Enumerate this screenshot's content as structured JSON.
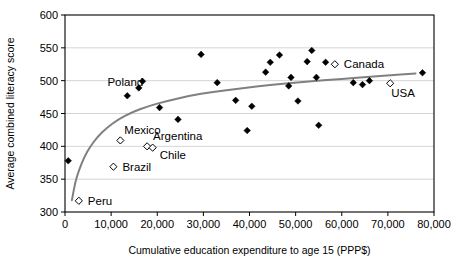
{
  "chart_data": {
    "type": "scatter",
    "title": "",
    "xlabel": "Cumulative education expenditure to age 15 (PPP$)",
    "ylabel": "Average combined literacy score",
    "xlim": [
      0,
      80000
    ],
    "ylim": [
      300,
      600
    ],
    "xticks": [
      0,
      10000,
      20000,
      30000,
      40000,
      50000,
      60000,
      70000,
      80000
    ],
    "xticklabels": [
      "0",
      "10,000",
      "20,000",
      "30,000",
      "40,000",
      "50,000",
      "60,000",
      "70,000",
      "80,000"
    ],
    "yticks": [
      300,
      350,
      400,
      450,
      500,
      550,
      600
    ],
    "yticklabels": [
      "300",
      "350",
      "400",
      "450",
      "500",
      "550",
      "600"
    ],
    "grid": "horizontal",
    "legend": "none",
    "series": [
      {
        "name": "Countries (unlabelled)",
        "marker": "filled-diamond",
        "color": "#000000",
        "points": [
          {
            "x": 700,
            "y": 378
          },
          {
            "x": 13500,
            "y": 477
          },
          {
            "x": 16000,
            "y": 489
          },
          {
            "x": 16800,
            "y": 499
          },
          {
            "x": 20500,
            "y": 459
          },
          {
            "x": 24500,
            "y": 441
          },
          {
            "x": 29500,
            "y": 540
          },
          {
            "x": 33000,
            "y": 497
          },
          {
            "x": 37000,
            "y": 470
          },
          {
            "x": 39500,
            "y": 424
          },
          {
            "x": 40500,
            "y": 461
          },
          {
            "x": 43500,
            "y": 513
          },
          {
            "x": 44500,
            "y": 528
          },
          {
            "x": 46500,
            "y": 539
          },
          {
            "x": 48500,
            "y": 492
          },
          {
            "x": 49000,
            "y": 505
          },
          {
            "x": 50500,
            "y": 469
          },
          {
            "x": 52500,
            "y": 529
          },
          {
            "x": 53500,
            "y": 546
          },
          {
            "x": 54500,
            "y": 505
          },
          {
            "x": 55000,
            "y": 432
          },
          {
            "x": 56500,
            "y": 528
          },
          {
            "x": 62500,
            "y": 497
          },
          {
            "x": 64500,
            "y": 494
          },
          {
            "x": 66000,
            "y": 500
          },
          {
            "x": 77500,
            "y": 512
          }
        ]
      },
      {
        "name": "Countries (labelled)",
        "marker": "open-diamond",
        "color": "#000000",
        "points": [
          {
            "x": 3000,
            "y": 317,
            "label": "Peru",
            "label_dx": 9,
            "label_dy": 4
          },
          {
            "x": 10500,
            "y": 369,
            "label": "Brazil",
            "label_dx": 9,
            "label_dy": 4
          },
          {
            "x": 12000,
            "y": 409,
            "label": "Mexico",
            "label_dx": 4,
            "label_dy": -6
          },
          {
            "x": 17800,
            "y": 400,
            "label": "Argentina",
            "label_dx": 6,
            "label_dy": -6
          },
          {
            "x": 19000,
            "y": 398,
            "label": "Chile",
            "label_dx": 7,
            "label_dy": 11
          },
          {
            "x": 58500,
            "y": 525,
            "label": "Canada",
            "label_dx": 9,
            "label_dy": 4
          },
          {
            "x": 70500,
            "y": 496,
            "label": "USA",
            "label_dx": 1,
            "label_dy": 14
          }
        ]
      }
    ],
    "annotations": [
      {
        "text": "Poland",
        "x": 9200,
        "y": 492
      }
    ],
    "trend": {
      "name": "logarithmic fit",
      "color": "#808080",
      "points": [
        {
          "x": 1500,
          "y": 318
        },
        {
          "x": 2200,
          "y": 345
        },
        {
          "x": 3000,
          "y": 363
        },
        {
          "x": 4200,
          "y": 384
        },
        {
          "x": 5500,
          "y": 400
        },
        {
          "x": 7000,
          "y": 414
        },
        {
          "x": 9000,
          "y": 428
        },
        {
          "x": 11500,
          "y": 441
        },
        {
          "x": 14500,
          "y": 452
        },
        {
          "x": 18000,
          "y": 461
        },
        {
          "x": 22000,
          "y": 469
        },
        {
          "x": 27000,
          "y": 477
        },
        {
          "x": 32000,
          "y": 483
        },
        {
          "x": 38000,
          "y": 488
        },
        {
          "x": 45000,
          "y": 494
        },
        {
          "x": 52000,
          "y": 498
        },
        {
          "x": 60000,
          "y": 503
        },
        {
          "x": 68000,
          "y": 507
        },
        {
          "x": 76000,
          "y": 511
        }
      ]
    }
  },
  "labels": {
    "peru": "Peru",
    "brazil": "Brazil",
    "mexico": "Mexico",
    "argentina": "Argentina",
    "chile": "Chile",
    "canada": "Canada",
    "usa": "USA",
    "poland": "Poland"
  }
}
